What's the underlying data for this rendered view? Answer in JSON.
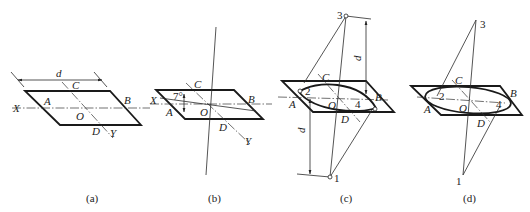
{
  "figure": {
    "colors": {
      "line": "#1a1a1a",
      "background": "#ffffff"
    },
    "panels": [
      {
        "id": "a",
        "caption": "(a)",
        "labels": {
          "X": "X",
          "Y": "Y",
          "A": "A",
          "B": "B",
          "C": "C",
          "D": "D",
          "O": "O",
          "dimension": "d"
        }
      },
      {
        "id": "b",
        "caption": "(b)",
        "labels": {
          "X": "X",
          "Y": "Y",
          "A": "A",
          "B": "B",
          "C": "C",
          "D": "D",
          "O": "O",
          "angle": "7°"
        }
      },
      {
        "id": "c",
        "caption": "(c)",
        "labels": {
          "A": "A",
          "B": "B",
          "C": "C",
          "D": "D",
          "O": "O",
          "p1": "1",
          "p2": "2",
          "p3": "3",
          "p4": "4",
          "dim_upper": "d",
          "dim_lower": "d"
        }
      },
      {
        "id": "d",
        "caption": "(d)",
        "labels": {
          "A": "A",
          "B": "B",
          "C": "C",
          "D": "D",
          "O": "O",
          "p1": "1",
          "p2": "2",
          "p3": "3",
          "p4": "4"
        }
      }
    ]
  }
}
